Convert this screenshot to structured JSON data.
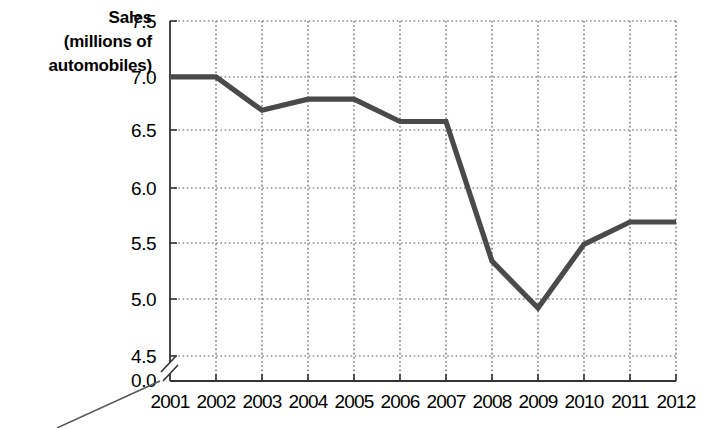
{
  "chart_data": {
    "type": "line",
    "title": "",
    "ylabel": "Sales (millions of automobiles)",
    "ylabel_lines": [
      "Sales",
      "(millions of",
      "automobiles)"
    ],
    "xlabel": "",
    "categories": [
      "2001",
      "2002",
      "2003",
      "2004",
      "2005",
      "2006",
      "2007",
      "2008",
      "2009",
      "2010",
      "2011",
      "2012"
    ],
    "values": [
      7.0,
      7.0,
      6.7,
      6.8,
      6.8,
      6.6,
      6.6,
      5.35,
      4.93,
      5.5,
      5.7,
      5.7
    ],
    "ytick_labels": [
      "7.5",
      "7.0",
      "6.5",
      "6.0",
      "5.5",
      "5.0",
      "4.5",
      "0.0"
    ],
    "ytick_values": [
      7.5,
      7.0,
      6.5,
      6.0,
      5.5,
      5.0,
      4.5,
      0.0
    ],
    "ylim": [
      4.5,
      7.5
    ],
    "axis_break": true,
    "grid": "dotted",
    "legend": "none",
    "series": [
      {
        "name": "Sales",
        "color": "#4a4a4a",
        "values": [
          7.0,
          7.0,
          6.7,
          6.8,
          6.8,
          6.6,
          6.6,
          5.35,
          4.93,
          5.5,
          5.7,
          5.7
        ]
      }
    ]
  },
  "colors": {
    "line": "#4a4a4a",
    "grid": "#555555",
    "axis": "#333333",
    "background": "#ffffff"
  }
}
